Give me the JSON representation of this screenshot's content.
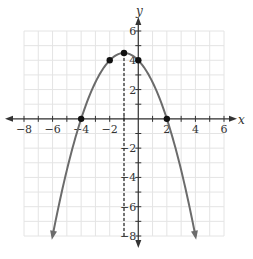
{
  "chart_data": {
    "type": "line",
    "title": "",
    "xlabel": "x",
    "ylabel": "y",
    "xlim": [
      -8,
      6
    ],
    "ylim": [
      -8,
      6
    ],
    "grid": true,
    "x_ticks": [
      -8,
      -6,
      -4,
      -2,
      2,
      4,
      6
    ],
    "y_ticks": [
      -8,
      -6,
      -4,
      -2,
      2,
      4,
      6
    ],
    "x_tick_labels": [
      "−8",
      "−6",
      "−4",
      "−2",
      "2",
      "4",
      "6"
    ],
    "y_tick_labels": [
      "−8",
      "−6",
      "−4",
      "−2",
      "2",
      "4",
      "6"
    ],
    "series": [
      {
        "name": "parabola",
        "equation": "y = -0.5(x + 1)^2 + 4.5",
        "x_range": [
          -6,
          4
        ],
        "arrows_at_ends": true,
        "color": "#6b6b6b"
      }
    ],
    "points": [
      {
        "x": -4,
        "y": 0
      },
      {
        "x": -2,
        "y": 4
      },
      {
        "x": -1,
        "y": 4.5
      },
      {
        "x": 0,
        "y": 4
      },
      {
        "x": 2,
        "y": 0
      }
    ],
    "axis_of_symmetry": {
      "x": -1,
      "style": "dashed",
      "y_range": [
        -8,
        4.5
      ]
    },
    "colors": {
      "grid": "#e4e4e4",
      "axis": "#333333",
      "curve": "#6b6b6b",
      "point": "#111111"
    }
  },
  "labels": {
    "x_axis": "x",
    "y_axis": "y"
  }
}
